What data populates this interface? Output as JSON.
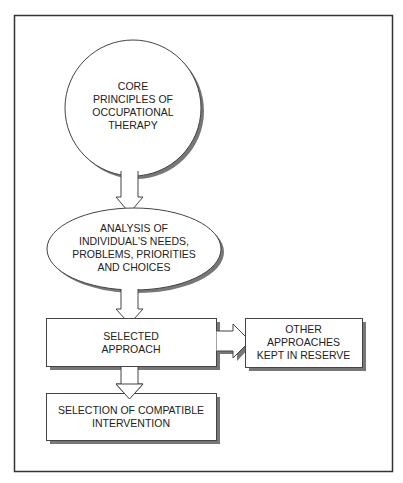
{
  "diagram": {
    "type": "flowchart",
    "colors": {
      "stroke": "#444444",
      "shadow": "#777777",
      "fill": "#ffffff",
      "frame": "#333333"
    },
    "nodes": [
      {
        "id": "core",
        "shape": "circle",
        "label_lines": [
          "CORE",
          "PRINCIPLES OF",
          "OCCUPATIONAL",
          "THERAPY"
        ]
      },
      {
        "id": "analysis",
        "shape": "ellipse",
        "label_lines": [
          "ANALYSIS OF",
          "INDIVIDUAL'S NEEDS,",
          "PROBLEMS, PRIORITIES",
          "AND CHOICES"
        ]
      },
      {
        "id": "selected",
        "shape": "rect",
        "label_lines": [
          "SELECTED",
          "APPROACH"
        ]
      },
      {
        "id": "other",
        "shape": "rect",
        "label_lines": [
          "OTHER",
          "APPROACHES",
          "KEPT IN RESERVE"
        ]
      },
      {
        "id": "intervention",
        "shape": "rect",
        "label_lines": [
          "SELECTION OF COMPATIBLE",
          "INTERVENTION"
        ]
      }
    ],
    "edges": [
      {
        "from": "core",
        "to": "analysis",
        "direction": "down"
      },
      {
        "from": "analysis",
        "to": "selected",
        "direction": "down"
      },
      {
        "from": "selected",
        "to": "other",
        "direction": "right"
      },
      {
        "from": "selected",
        "to": "intervention",
        "direction": "down"
      }
    ]
  }
}
